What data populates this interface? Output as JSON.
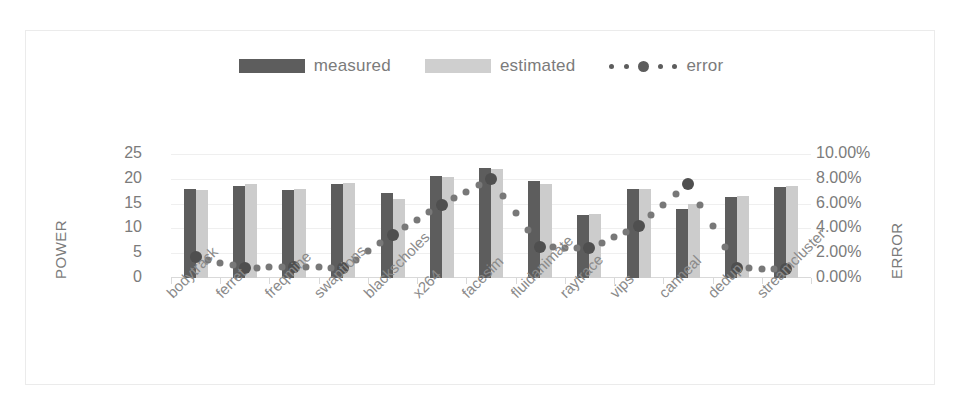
{
  "legend": {
    "items": [
      {
        "label": "measured",
        "icon": "bar-swatch-dark",
        "color": "#5d5d5d"
      },
      {
        "label": "estimated",
        "icon": "bar-swatch-light",
        "color": "#cfcfcf"
      },
      {
        "label": "error",
        "icon": "dotted-line-marker",
        "color": "#5d5d5d"
      }
    ]
  },
  "axes": {
    "left": {
      "title": "POWER",
      "ticks": [
        "0",
        "5",
        "10",
        "15",
        "20",
        "25"
      ],
      "min": 0,
      "max": 25
    },
    "right": {
      "title": "ERROR",
      "ticks": [
        "0.00%",
        "2.00%",
        "4.00%",
        "6.00%",
        "8.00%",
        "10.00%"
      ],
      "min": 0,
      "max": 10
    }
  },
  "chart_data": {
    "type": "bar",
    "title": "",
    "xlabel": "",
    "ylabel": "POWER",
    "y2label": "ERROR",
    "ylim": [
      0,
      25
    ],
    "y2lim": [
      0,
      10
    ],
    "grid": true,
    "legend_position": "top",
    "categories": [
      "bodytrack",
      "ferret",
      "freqmine",
      "swaptions",
      "blackscholes",
      "x264",
      "facesim",
      "fluidanimate",
      "raytrace",
      "vips",
      "canneal",
      "dedup",
      "streamcluster"
    ],
    "series": [
      {
        "name": "measured",
        "axis": "left",
        "type": "bar",
        "color": "#5d5d5d",
        "values": [
          18.0,
          18.6,
          17.8,
          19.0,
          17.2,
          20.6,
          22.2,
          19.6,
          12.7,
          17.9,
          14.0,
          16.3,
          18.3
        ]
      },
      {
        "name": "estimated",
        "axis": "left",
        "type": "bar",
        "color": "#cccccc",
        "values": [
          17.8,
          18.9,
          18.0,
          19.2,
          16.0,
          20.4,
          22.0,
          19.0,
          13.0,
          18.0,
          15.0,
          16.5,
          18.5
        ]
      },
      {
        "name": "error",
        "axis": "right",
        "type": "scatter",
        "color": "#5a5a5a",
        "unit": "%",
        "values": [
          1.7,
          0.8,
          0.9,
          0.8,
          3.5,
          5.9,
          8.0,
          2.5,
          2.4,
          4.2,
          7.6,
          0.8,
          0.7
        ]
      }
    ]
  }
}
